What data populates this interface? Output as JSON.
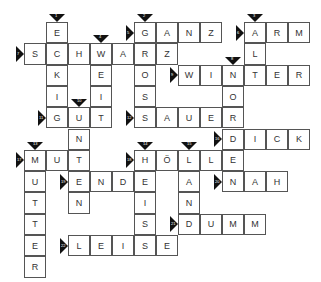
{
  "puzzle": {
    "type": "crossword",
    "layout": {
      "x0": 24,
      "y0": 22,
      "cell_w": 22,
      "cell_h": 21.3
    },
    "words": [
      {
        "num": "1",
        "dir": "down",
        "row": 0,
        "col": 1,
        "answer": "ECKIG"
      },
      {
        "num": "2",
        "dir": "down",
        "row": 0,
        "col": 5,
        "answer": "GROSS"
      },
      {
        "num": "3",
        "dir": "down",
        "row": 0,
        "col": 10,
        "answer": "ALT"
      },
      {
        "num": "4",
        "dir": "down",
        "row": 1,
        "col": 3,
        "answer": "WEIT"
      },
      {
        "num": "5",
        "dir": "across",
        "row": 0,
        "col": 5,
        "answer": "GANZ"
      },
      {
        "num": "6",
        "dir": "across",
        "row": 0,
        "col": 10,
        "answer": "ARM"
      },
      {
        "num": "7",
        "dir": "across",
        "row": 1,
        "col": 0,
        "answer": "SCHWARZ"
      },
      {
        "num": "8",
        "dir": "down",
        "row": 2,
        "col": 9,
        "answer": "NORD"
      },
      {
        "num": "9",
        "dir": "across",
        "row": 2,
        "col": 7,
        "answer": "WINTER"
      },
      {
        "num": "10",
        "dir": "down",
        "row": 4,
        "col": 2,
        "answer": "UNTEN"
      },
      {
        "num": "11",
        "dir": "across",
        "row": 4,
        "col": 1,
        "answer": "GUT"
      },
      {
        "num": "12",
        "dir": "across",
        "row": 4,
        "col": 5,
        "answer": "SAUER"
      },
      {
        "num": "13",
        "dir": "down",
        "row": 6,
        "col": 0,
        "answer": "MUTTER"
      },
      {
        "num": "14",
        "dir": "down",
        "row": 6,
        "col": 5,
        "answer": "HEISS"
      },
      {
        "num": "15",
        "dir": "down",
        "row": 6,
        "col": 7,
        "answer": "LAND"
      },
      {
        "num": "16",
        "dir": "across",
        "row": 5,
        "col": 9,
        "answer": "DICK"
      },
      {
        "num": "17",
        "dir": "across",
        "row": 6,
        "col": 0,
        "answer": "MUT"
      },
      {
        "num": "18",
        "dir": "across",
        "row": 6,
        "col": 5,
        "answer": "HÖLLE"
      },
      {
        "num": "19",
        "dir": "across",
        "row": 7,
        "col": 2,
        "answer": "ENDE"
      },
      {
        "num": "20",
        "dir": "across",
        "row": 7,
        "col": 9,
        "answer": "NAH"
      },
      {
        "num": "21",
        "dir": "across",
        "row": 9,
        "col": 7,
        "answer": "DUMM"
      },
      {
        "num": "22",
        "dir": "across",
        "row": 10,
        "col": 2,
        "answer": "LEISE"
      }
    ]
  }
}
